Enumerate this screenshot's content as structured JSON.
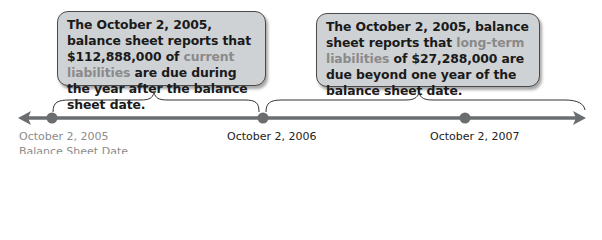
{
  "callouts": [
    {
      "parts": [
        {
          "text": "The October 2, 2005, balance sheet reports that $112,888,000 of ",
          "highlight": false
        },
        {
          "text": "current liabilities",
          "highlight": true
        },
        {
          "text": " are due during the year after the balance sheet date.",
          "highlight": false
        }
      ]
    },
    {
      "parts": [
        {
          "text": "The October 2, 2005, balance sheet reports that ",
          "highlight": false
        },
        {
          "text": "long-term liabilities",
          "highlight": true
        },
        {
          "text": " of $27,288,000 are due beyond one year of the balance sheet date.",
          "highlight": false
        }
      ]
    }
  ],
  "timeline": {
    "points": [
      {
        "label_line1": "October 2, 2005",
        "label_line2": "Balance Sheet Date",
        "x": 52
      },
      {
        "label_line1": "October 2, 2006",
        "x": 263
      },
      {
        "label_line1": "October 2, 2007",
        "x": 465
      }
    ]
  },
  "colors": {
    "line": "#6b6e70",
    "callout_bg": "#cfd2d4",
    "highlight_text": "#8a8a8a",
    "label_gray": "#8c8c8c"
  }
}
